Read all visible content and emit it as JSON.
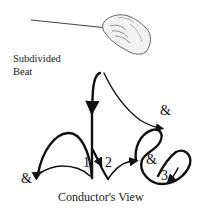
{
  "diagram": {
    "title_line1": "Subdivided",
    "title_line2": "Beat",
    "caption": "Conductor's View",
    "beat_labels": {
      "and_top": "&",
      "and_left": "&",
      "one": "1",
      "two": "2",
      "and_right": "&",
      "three": "3"
    },
    "illustration": "conductor-hand-with-baton",
    "colors": {
      "stroke": "#111111",
      "background": "#ffffff"
    }
  }
}
